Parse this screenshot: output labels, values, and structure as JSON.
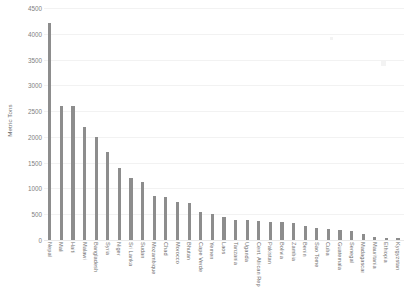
{
  "chart_data": {
    "type": "bar",
    "title": "",
    "subtitle": "",
    "xlabel": "",
    "ylabel": "Metric Tons",
    "ylim": [
      0,
      4500
    ],
    "ytick_labels": [
      "4500",
      "4000",
      "3500",
      "3000",
      "2500",
      "2000",
      "1500",
      "1000",
      "500",
      "0"
    ],
    "ytick_values": [
      4500,
      4000,
      3500,
      3000,
      2500,
      2000,
      1500,
      1000,
      500,
      0
    ],
    "grid": true,
    "legend": false,
    "bar_color": "#8d8d8d",
    "gridline_color": "#f2f2f2",
    "background_color": "#ffffff",
    "categories": [
      "Nepal",
      "Mali",
      "Haiti",
      "Malawi",
      "Bangladesh",
      "Syria",
      "Niger",
      "Sri Lanka",
      "Sudan",
      "Mozambique",
      "Chad",
      "Morocco",
      "Bhutan",
      "Cape Verde",
      "Yemen",
      "Laos",
      "Tanzania",
      "Uganda",
      "Cent. African Rep",
      "Pakistan",
      "Bolivia",
      "Zambia",
      "Benin",
      "Sao Tome",
      "Cuba",
      "Guatemala",
      "Senegal",
      "Madagascar",
      "Mauritania",
      "Ethiopia",
      "Kyrgyzstan"
    ],
    "values": [
      4200,
      2600,
      2600,
      2200,
      2000,
      1700,
      1400,
      1200,
      1130,
      860,
      830,
      730,
      720,
      550,
      500,
      450,
      390,
      385,
      360,
      355,
      340,
      335,
      270,
      230,
      220,
      190,
      175,
      120,
      60,
      45,
      30
    ]
  }
}
